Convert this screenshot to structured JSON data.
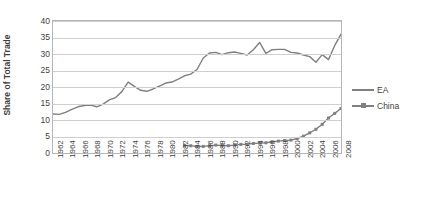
{
  "chart_data": {
    "type": "line",
    "title": "",
    "xlabel": "",
    "ylabel": "Share of Total Trade",
    "ylim": [
      0,
      40
    ],
    "yticks": [
      0,
      5,
      10,
      15,
      20,
      25,
      30,
      35,
      40
    ],
    "xlim": [
      1962,
      2008
    ],
    "xticks": [
      1962,
      1964,
      1966,
      1968,
      1970,
      1972,
      1974,
      1976,
      1978,
      1980,
      1982,
      1984,
      1986,
      1988,
      1990,
      1992,
      1994,
      1996,
      1998,
      2000,
      2002,
      2004,
      2006,
      2008
    ],
    "grid": "horizontal",
    "legend_position": "right",
    "colors": {
      "series": "#808080",
      "grid": "#cfcfcf",
      "axis": "#b6b6b6",
      "text": "#3f3f3f"
    },
    "series": [
      {
        "name": "EA",
        "marker": "none",
        "x": [
          1962,
          1963,
          1964,
          1965,
          1966,
          1967,
          1968,
          1969,
          1970,
          1971,
          1972,
          1973,
          1974,
          1975,
          1976,
          1977,
          1978,
          1979,
          1980,
          1981,
          1982,
          1983,
          1984,
          1985,
          1986,
          1987,
          1988,
          1989,
          1990,
          1991,
          1992,
          1993,
          1994,
          1995,
          1996,
          1997,
          1998,
          1999,
          2000,
          2001,
          2002,
          2003,
          2004,
          2005,
          2006,
          2007,
          2008
        ],
        "values": [
          11.8,
          11.7,
          12.3,
          13.2,
          14.0,
          14.4,
          14.5,
          14.0,
          14.8,
          16.1,
          16.8,
          18.6,
          21.5,
          20.2,
          19.0,
          18.7,
          19.4,
          20.3,
          21.2,
          21.5,
          22.4,
          23.4,
          23.9,
          25.3,
          28.8,
          30.3,
          30.5,
          29.8,
          30.4,
          30.6,
          30.2,
          29.7,
          31.3,
          33.5,
          30.2,
          31.3,
          31.4,
          31.4,
          30.5,
          30.3,
          29.7,
          29.2,
          27.5,
          29.8,
          28.3,
          32.6,
          36.0
        ]
      },
      {
        "name": "China",
        "marker": "square",
        "x": [
          1983,
          1984,
          1985,
          1986,
          1987,
          1988,
          1989,
          1990,
          1991,
          1992,
          1993,
          1994,
          1995,
          1996,
          1997,
          1998,
          1999,
          2000,
          2001,
          2002,
          2003,
          2004,
          2005,
          2006,
          2007,
          2008
        ],
        "values": [
          2.3,
          2.2,
          2.0,
          2.0,
          2.2,
          2.4,
          2.3,
          2.2,
          2.4,
          2.6,
          2.6,
          2.9,
          3.0,
          3.1,
          3.4,
          3.6,
          3.8,
          3.9,
          4.4,
          5.1,
          6.1,
          7.2,
          8.7,
          10.6,
          12.0,
          13.5
        ]
      }
    ]
  }
}
